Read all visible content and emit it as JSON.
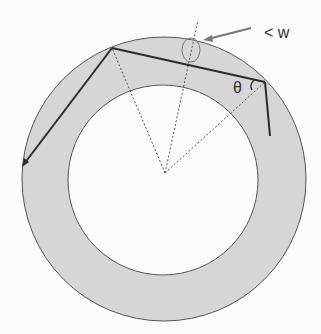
{
  "diagram": {
    "labels": {
      "width_marker": "< w",
      "angle": "θ"
    },
    "colors": {
      "background": "#fbfbfb",
      "annulus_fill": "#d6d6d6",
      "circle_stroke": "#555555",
      "ray": "#2b2b2b",
      "dashed": "#555555",
      "marker": "#777777"
    },
    "geometry": {
      "center": [
        164,
        179
      ],
      "outer_radius": 142,
      "inner_radius": 95,
      "ray_points": [
        [
          24,
          164
        ],
        [
          112,
          48
        ],
        [
          265,
          82
        ],
        [
          270,
          136
        ]
      ],
      "radial_lines_origin": [
        165,
        173
      ]
    }
  }
}
